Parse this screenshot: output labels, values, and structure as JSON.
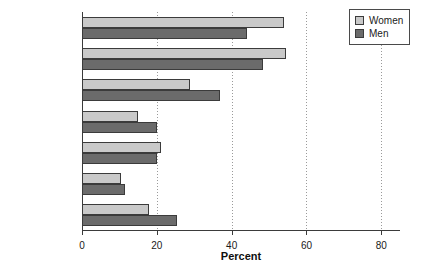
{
  "chart_data": {
    "type": "bar",
    "orientation": "horizontal",
    "title": "",
    "xlabel": "Percent",
    "ylabel": "",
    "xlim": [
      0,
      85
    ],
    "xticks": [
      0,
      20,
      40,
      60,
      80
    ],
    "xtick_labels": [
      "0",
      "20",
      "40",
      "60",
      "80"
    ],
    "grid": "vertical-dotted",
    "legend_position": "top-right",
    "categories": [
      "Arthritis",
      "Hypertension",
      "Heart disease",
      "Diabetes",
      "Respiratory\ndiseases*",
      "Stroke",
      "Cancer"
    ],
    "series": [
      {
        "name": "Women",
        "color": "#c9c9c9",
        "values": [
          54,
          54.5,
          29,
          15,
          21,
          10.5,
          18
        ]
      },
      {
        "name": "Men",
        "color": "#6b6b6b",
        "values": [
          44,
          48.5,
          37,
          20,
          20,
          11.5,
          25.5
        ]
      }
    ]
  },
  "legend": {
    "items": [
      {
        "label": "Women",
        "swatch": "women"
      },
      {
        "label": "Men",
        "swatch": "men"
      }
    ]
  }
}
